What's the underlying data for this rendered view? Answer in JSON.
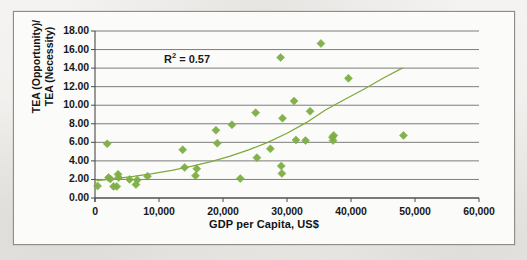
{
  "chart_data": {
    "type": "scatter",
    "title": "",
    "xlabel": "GDP per Capita, US$",
    "ylabel": "TEA (Opportunity)/ TEA (Necessity)",
    "ylabel_line1": "TEA (Opportunity)/",
    "ylabel_line2": "TEA (Necessity)",
    "xlim": [
      0,
      60000
    ],
    "ylim": [
      0,
      18
    ],
    "xticks": [
      0,
      10000,
      20000,
      30000,
      40000,
      50000,
      60000
    ],
    "xtick_labels": [
      "0",
      "10,000",
      "20,000",
      "30,000",
      "40,000",
      "50,000",
      "60,000"
    ],
    "yticks": [
      0,
      2,
      4,
      6,
      8,
      10,
      12,
      14,
      16,
      18
    ],
    "ytick_labels": [
      "0.00",
      "2.00",
      "4.00",
      "6.00",
      "8.00",
      "10.00",
      "12.00",
      "14.00",
      "16.00",
      "18.00"
    ],
    "grid": "horizontal",
    "legend": "none",
    "annotations": [
      {
        "name": "r-squared",
        "text_prefix": "R",
        "text_sup": "2",
        "text_suffix": " = 0.57",
        "value": 0.57,
        "x": 14500,
        "y": 15.0
      }
    ],
    "marker": {
      "shape": "diamond",
      "color": "#7DAF44",
      "size": 4
    },
    "series": [
      {
        "name": "Countries",
        "points": [
          {
            "x": 400,
            "y": 1.3
          },
          {
            "x": 1900,
            "y": 5.85
          },
          {
            "x": 2100,
            "y": 2.2
          },
          {
            "x": 2400,
            "y": 2.05
          },
          {
            "x": 2900,
            "y": 1.25
          },
          {
            "x": 3400,
            "y": 1.25
          },
          {
            "x": 3600,
            "y": 2.55
          },
          {
            "x": 3700,
            "y": 2.2
          },
          {
            "x": 5400,
            "y": 2.0
          },
          {
            "x": 6400,
            "y": 1.45
          },
          {
            "x": 6600,
            "y": 1.95
          },
          {
            "x": 8200,
            "y": 2.35
          },
          {
            "x": 13700,
            "y": 5.2
          },
          {
            "x": 14000,
            "y": 3.3
          },
          {
            "x": 15700,
            "y": 2.4
          },
          {
            "x": 15900,
            "y": 3.15
          },
          {
            "x": 18900,
            "y": 7.3
          },
          {
            "x": 19100,
            "y": 5.9
          },
          {
            "x": 21400,
            "y": 7.9
          },
          {
            "x": 22700,
            "y": 2.1
          },
          {
            "x": 25100,
            "y": 9.2
          },
          {
            "x": 25300,
            "y": 4.35
          },
          {
            "x": 27400,
            "y": 5.3
          },
          {
            "x": 29000,
            "y": 15.15
          },
          {
            "x": 29300,
            "y": 8.6
          },
          {
            "x": 29100,
            "y": 3.45
          },
          {
            "x": 29200,
            "y": 2.65
          },
          {
            "x": 31100,
            "y": 10.45
          },
          {
            "x": 31400,
            "y": 6.25
          },
          {
            "x": 32900,
            "y": 6.2
          },
          {
            "x": 33600,
            "y": 9.35
          },
          {
            "x": 35300,
            "y": 16.65
          },
          {
            "x": 37100,
            "y": 6.55
          },
          {
            "x": 37200,
            "y": 6.2
          },
          {
            "x": 37300,
            "y": 6.75
          },
          {
            "x": 39600,
            "y": 12.9
          },
          {
            "x": 48200,
            "y": 6.75
          }
        ]
      }
    ],
    "trendline": {
      "type": "exponential",
      "color": "#7FA83F",
      "r_squared": 0.57,
      "x_start": 300,
      "x_end": 48000,
      "points": [
        {
          "x": 300,
          "y": 1.88
        },
        {
          "x": 3000,
          "y": 2.07
        },
        {
          "x": 6000,
          "y": 2.32
        },
        {
          "x": 9000,
          "y": 2.62
        },
        {
          "x": 12000,
          "y": 2.98
        },
        {
          "x": 15000,
          "y": 3.4
        },
        {
          "x": 18000,
          "y": 3.9
        },
        {
          "x": 21000,
          "y": 4.48
        },
        {
          "x": 24000,
          "y": 5.18
        },
        {
          "x": 27000,
          "y": 6.0
        },
        {
          "x": 30000,
          "y": 6.98
        },
        {
          "x": 33000,
          "y": 8.12
        },
        {
          "x": 36000,
          "y": 9.48
        },
        {
          "x": 39000,
          "y": 10.62
        },
        {
          "x": 42000,
          "y": 11.72
        },
        {
          "x": 45000,
          "y": 12.9
        },
        {
          "x": 48000,
          "y": 14.0
        }
      ]
    }
  }
}
